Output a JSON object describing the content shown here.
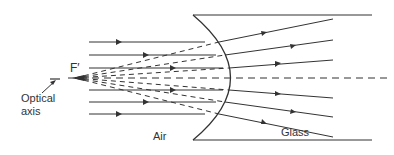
{
  "diagram": {
    "labels": {
      "focal_point": "F′",
      "optical_axis_line1": "Optical",
      "optical_axis_line2": "axis",
      "air": "Air",
      "glass": "Glass"
    },
    "colors": {
      "line": "#333333",
      "background": "#ffffff"
    },
    "rays": {
      "count": 6,
      "incoming_y": [
        42,
        55,
        68,
        90,
        102,
        114
      ],
      "outgoing_end_y": [
        19,
        40,
        60,
        98,
        117,
        137
      ]
    }
  }
}
